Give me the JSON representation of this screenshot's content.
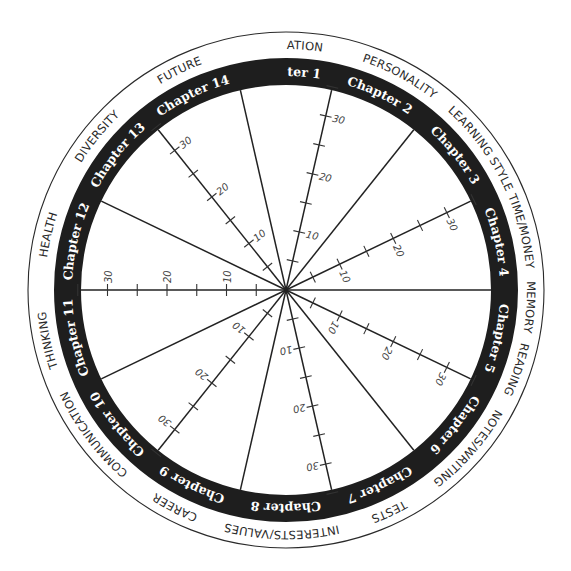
{
  "diagram": {
    "type": "wheel",
    "center": [
      286,
      290
    ],
    "radii": {
      "outer": 258,
      "ring_outer": 232,
      "ring_inner": 205
    },
    "colors": {
      "ring": "#1e1e1e",
      "line": "#222222",
      "background": "#ffffff",
      "chapter_text": "#ffffff",
      "topic_text": "#2a2a2a"
    },
    "scale": {
      "px_per_unit": 5.95,
      "tick_every": 5,
      "max": 35,
      "labels": [
        10,
        20,
        30
      ]
    },
    "chapters": [
      {
        "label": "Chapter 1",
        "angle": 0
      },
      {
        "label": "Chapter 2",
        "angle": 25.71
      },
      {
        "label": "Chapter 3",
        "angle": 51.43
      },
      {
        "label": "Chapter 4",
        "angle": 77.14
      },
      {
        "label": "Chapter 5",
        "angle": 102.86
      },
      {
        "label": "Chapter 6",
        "angle": 128.57
      },
      {
        "label": "Chapter 7",
        "angle": 154.29
      },
      {
        "label": "Chapter 8",
        "angle": 180
      },
      {
        "label": "Chapter 9",
        "angle": 205.71
      },
      {
        "label": "Chapter 10",
        "angle": 231.43
      },
      {
        "label": "Chapter 11",
        "angle": 257.14
      },
      {
        "label": "Chapter 12",
        "angle": 282.86
      },
      {
        "label": "Chapter 13",
        "angle": 308.57
      },
      {
        "label": "Chapter 14",
        "angle": 334.29
      }
    ],
    "topics": [
      {
        "label": "MOTIVATION",
        "angle": 0
      },
      {
        "label": "PERSONALITY",
        "angle": 28
      },
      {
        "label": "LEARNING STYLE",
        "angle": 54
      },
      {
        "label": "TIME/MONEY",
        "angle": 76
      },
      {
        "label": "MEMORY",
        "angle": 94
      },
      {
        "label": "READING",
        "angle": 109
      },
      {
        "label": "NOTES/WRITING",
        "angle": 131
      },
      {
        "label": "TESTS",
        "angle": 155
      },
      {
        "label": "INTERESTS/VALUES",
        "angle": 181
      },
      {
        "label": "CAREER",
        "angle": 207
      },
      {
        "label": "COMMUNICATION",
        "angle": 233
      },
      {
        "label": "THINKING",
        "angle": 258
      },
      {
        "label": "HEALTH",
        "angle": 283
      },
      {
        "label": "DIVERSITY",
        "angle": 309
      },
      {
        "label": "FUTURE",
        "angle": 334
      }
    ],
    "spokes": [
      {
        "angle": 12.86,
        "scaled": true
      },
      {
        "angle": 38.57,
        "scaled": false
      },
      {
        "angle": 64.29,
        "scaled": true
      },
      {
        "angle": 90,
        "scaled": false
      },
      {
        "angle": 115.71,
        "scaled": true
      },
      {
        "angle": 141.43,
        "scaled": false
      },
      {
        "angle": 167.14,
        "scaled": true
      },
      {
        "angle": 192.86,
        "scaled": false
      },
      {
        "angle": 218.57,
        "scaled": true
      },
      {
        "angle": 244.29,
        "scaled": false
      },
      {
        "angle": 270,
        "scaled": true
      },
      {
        "angle": 295.71,
        "scaled": false
      },
      {
        "angle": 321.43,
        "scaled": true
      },
      {
        "angle": 347.14,
        "scaled": false
      }
    ]
  }
}
